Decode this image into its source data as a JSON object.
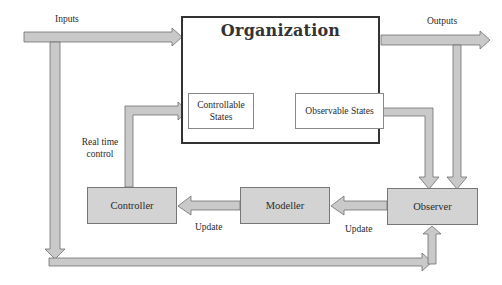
{
  "diagram": {
    "title": "Organization",
    "nodes": {
      "organization": "Organization",
      "controllable_states": "Controllable States",
      "observable_states": "Observable States",
      "controller": "Controller",
      "modeller": "Modeller",
      "observer": "Observer"
    },
    "labels": {
      "inputs": "Inputs",
      "outputs": "Outputs",
      "real_time_line1": "Real time",
      "real_time_line2": "control",
      "update_left": "Update",
      "update_right": "Update"
    },
    "edges": [
      {
        "from": "external",
        "to": "organization",
        "label": "Inputs"
      },
      {
        "from": "organization",
        "to": "external",
        "label": "Outputs"
      },
      {
        "from": "outputs",
        "to": "observer",
        "label": ""
      },
      {
        "from": "observable_states",
        "to": "observer",
        "label": ""
      },
      {
        "from": "observer",
        "to": "modeller",
        "label": "Update"
      },
      {
        "from": "modeller",
        "to": "controller",
        "label": "Update"
      },
      {
        "from": "controller",
        "to": "controllable_states",
        "label": "Real time control"
      },
      {
        "from": "inputs",
        "to": "observer",
        "label": ""
      }
    ],
    "colors": {
      "arrow_fill": "#c9c9c9",
      "arrow_stroke": "#6e6e6e",
      "box_fill": "#d3d3d3",
      "org_border": "#333333"
    }
  }
}
